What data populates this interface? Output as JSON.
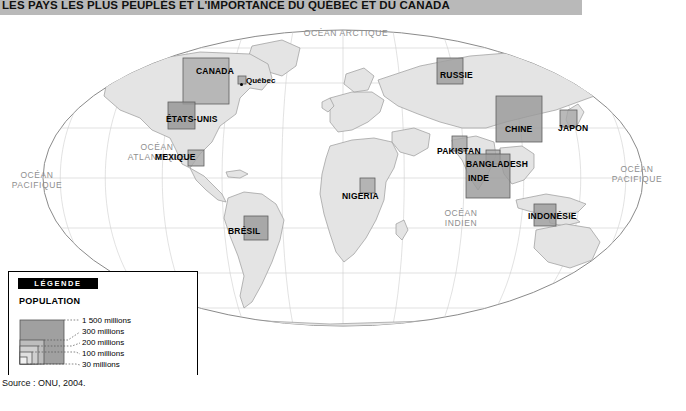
{
  "title": "LES PAYS LES PLUS PEUPLÉS ET L'IMPORTANCE DU QUÉBEC ET DU CANADA",
  "source": "Source : ONU, 2004.",
  "legend": {
    "header": "LÉGENDE",
    "subtitle": "POPULATION",
    "items": [
      {
        "label": "1 500 millions",
        "size": 44
      },
      {
        "label": "300 millions",
        "size": 24
      },
      {
        "label": "200 millions",
        "size": 18
      },
      {
        "label": "100 millions",
        "size": 12
      },
      {
        "label": "30 millions",
        "size": 7
      }
    ]
  },
  "oceans": [
    {
      "name": "OCÉAN ARCTIQUE",
      "x": 344,
      "y": 13
    },
    {
      "name": "OCÉAN<br>ATLANTIQUE",
      "x": 155,
      "y": 129
    },
    {
      "name": "OCÉAN<br>PACIFIQUE",
      "x": 20,
      "y": 158
    },
    {
      "name": "OCÉAN<br>PACIFIQUE",
      "x": 610,
      "y": 152
    },
    {
      "name": "OCÉAN<br>INDIEN",
      "x": 455,
      "y": 195
    }
  ],
  "countries": [
    {
      "name": "CANADA",
      "x": 196,
      "y": 50
    },
    {
      "name": "ÉTATS-UNIS",
      "x": 168,
      "y": 98
    },
    {
      "name": "MEXIQUE",
      "x": 172,
      "y": 135
    },
    {
      "name": "BRÉSIL",
      "x": 253,
      "y": 210
    },
    {
      "name": "NIGERIA",
      "x": 361,
      "y": 173
    },
    {
      "name": "RUSSIE",
      "x": 457,
      "y": 52
    },
    {
      "name": "CHINE",
      "x": 512,
      "y": 108
    },
    {
      "name": "JAPON",
      "x": 565,
      "y": 105
    },
    {
      "name": "PAKISTAN",
      "x": 458,
      "y": 129
    },
    {
      "name": "BANGLADESH",
      "x": 481,
      "y": 141
    },
    {
      "name": "INDE",
      "x": 484,
      "y": 155
    },
    {
      "name": "INDONÉSIE",
      "x": 546,
      "y": 195
    }
  ],
  "cities": [
    {
      "name": "Québec",
      "x": 251,
      "y": 63,
      "dot_x": 246,
      "dot_y": 70
    }
  ],
  "colors": {
    "title_band": "#b9b9b9",
    "land": "#e4e4e4",
    "land_stroke": "#9a9a9a",
    "ocean": "#ffffff",
    "symbol_fill": "#9e9e9e",
    "symbol_stroke": "#5a5a5a",
    "graticule": "#bfbfbf"
  }
}
